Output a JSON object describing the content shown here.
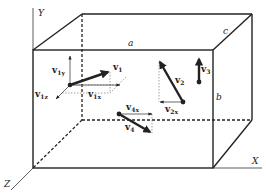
{
  "figure": {
    "type": "3D box with velocity vectors",
    "axes": {
      "x": "X",
      "y": "Y",
      "z": "Z"
    },
    "edge_labels": {
      "a": "a",
      "b": "b",
      "c": "c"
    },
    "colors": {
      "line": "#222222",
      "background": "#ffffff"
    },
    "vectors": [
      {
        "name": "v",
        "sub": "1",
        "components": [
          {
            "name": "v",
            "sub": "1y"
          },
          {
            "name": "v",
            "sub": "1x"
          },
          {
            "name": "v",
            "sub": "1z"
          }
        ]
      },
      {
        "name": "v",
        "sub": "2",
        "components": [
          {
            "name": "v",
            "sub": "2x"
          }
        ]
      },
      {
        "name": "v",
        "sub": "3",
        "components": []
      },
      {
        "name": "v",
        "sub": "4",
        "components": [
          {
            "name": "v",
            "sub": "4x"
          }
        ]
      }
    ]
  }
}
